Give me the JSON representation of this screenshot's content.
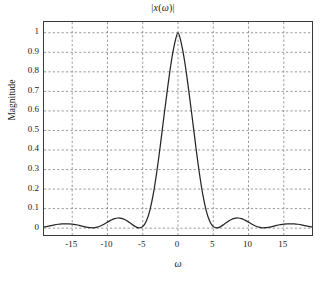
{
  "chart_data": {
    "type": "line",
    "title": "|x(ω)|",
    "xlabel": "ω",
    "ylabel": "Magnitude",
    "xlim": [
      -19,
      19
    ],
    "ylim": [
      -0.035,
      1.055
    ],
    "grid": true,
    "legend": null,
    "xticks": [
      -15,
      -10,
      -5,
      0,
      5,
      10,
      15
    ],
    "xtick_labels": [
      "-15",
      "-10",
      "-5",
      "0",
      "5",
      "10",
      "15"
    ],
    "yticks": [
      0,
      0.1,
      0.2,
      0.3,
      0.4,
      0.5,
      0.6,
      0.7,
      0.8,
      0.9,
      1
    ],
    "ytick_labels": [
      "0",
      "0.1",
      "0.2",
      "0.3",
      "0.4",
      "0.5",
      "0.6",
      "0.7",
      "0.8",
      "0.9",
      "1"
    ],
    "series": [
      {
        "name": "|x(ω)|",
        "color": "#262626",
        "x": [
          -19.0,
          -18.5,
          -18.0,
          -17.5,
          -17.0,
          -16.5,
          -16.0,
          -15.5,
          -15.0,
          -14.5,
          -14.0,
          -13.5,
          -13.0,
          -12.5,
          -12.0,
          -11.5,
          -11.0,
          -10.5,
          -10.0,
          -9.5,
          -9.0,
          -8.5,
          -8.0,
          -7.5,
          -7.0,
          -6.5,
          -6.0,
          -5.5,
          -5.0,
          -4.5,
          -4.0,
          -3.5,
          -3.0,
          -2.5,
          -2.0,
          -1.5,
          -1.0,
          -0.5,
          0.0,
          0.5,
          1.0,
          1.5,
          2.0,
          2.5,
          3.0,
          3.5,
          4.0,
          4.5,
          5.0,
          5.5,
          6.0,
          6.5,
          7.0,
          7.5,
          8.0,
          8.5,
          9.0,
          9.5,
          10.0,
          10.5,
          11.0,
          11.5,
          12.0,
          12.5,
          13.0,
          13.5,
          14.0,
          14.5,
          15.0,
          15.5,
          16.0,
          16.5,
          17.0,
          17.5,
          18.0,
          18.5,
          19.0
        ],
        "y": [
          0.006,
          0.009,
          0.013,
          0.017,
          0.02,
          0.022,
          0.022,
          0.022,
          0.021,
          0.018,
          0.014,
          0.009,
          0.005,
          0.003,
          0.002,
          0.005,
          0.011,
          0.02,
          0.031,
          0.041,
          0.049,
          0.052,
          0.05,
          0.043,
          0.032,
          0.019,
          0.007,
          0.001,
          0.008,
          0.035,
          0.09,
          0.175,
          0.29,
          0.425,
          0.57,
          0.71,
          0.84,
          0.94,
          1.0,
          0.94,
          0.84,
          0.71,
          0.57,
          0.425,
          0.29,
          0.175,
          0.09,
          0.035,
          0.008,
          0.001,
          0.007,
          0.019,
          0.032,
          0.043,
          0.05,
          0.052,
          0.049,
          0.041,
          0.031,
          0.02,
          0.011,
          0.005,
          0.002,
          0.003,
          0.005,
          0.009,
          0.014,
          0.018,
          0.021,
          0.022,
          0.022,
          0.022,
          0.02,
          0.017,
          0.013,
          0.009,
          0.006
        ]
      }
    ],
    "annotations": {
      "peak_value": 1,
      "peak_position": 0,
      "first_null": 5.5,
      "first_sidelobe_peak": 0.052,
      "first_sidelobe_position": 8.7,
      "second_sidelobe_peak": 0.022,
      "second_sidelobe_position": 16.2
    }
  },
  "style": {
    "axis_color": "#3a3a3a",
    "grid_color": "#8c8c8c",
    "curve_color": "#262626",
    "background": "#ffffff"
  }
}
